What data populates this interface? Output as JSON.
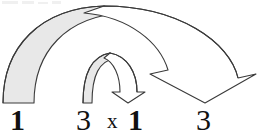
{
  "figure": {
    "background_color": "#ffffff",
    "stroke_color": "#3a3a3a",
    "fill_gray": "#e8e8e8",
    "text_color": "#111111",
    "width": 260,
    "height": 139
  },
  "expression": {
    "terms": [
      {
        "id": "left-outer",
        "label": "1",
        "weight": "bold",
        "x": 10,
        "y": 1
      },
      {
        "id": "left-inner",
        "label": "3",
        "weight": "normal",
        "x": 76,
        "y": 1
      },
      {
        "id": "times",
        "label": "x",
        "weight": "normal",
        "x": 107,
        "y": 7
      },
      {
        "id": "right-inner",
        "label": "1",
        "weight": "bold",
        "x": 128,
        "y": 1
      },
      {
        "id": "right-outer",
        "label": "3",
        "weight": "normal",
        "x": 196,
        "y": 1
      }
    ]
  },
  "arcs": {
    "outer": {
      "name": "outer-arc-arrow",
      "description": "Large arch from left bold 1 over to right 3",
      "from_term": "1",
      "to_term": "3",
      "filled": true,
      "fill": "#e8e8e8",
      "stroke": "#3a3a3a",
      "arrowhead": "down",
      "tip_x": 205,
      "tip_y": 103
    },
    "inner": {
      "name": "inner-arc-arrow",
      "description": "Small arch from inner 3 over to bold 1",
      "from_term": "3",
      "to_term": "1",
      "filled": true,
      "fill": "#e8e8e8",
      "stroke": "#3a3a3a",
      "arrowhead": "down",
      "tip_x": 128,
      "tip_y": 103
    }
  },
  "artifacts": {
    "scan_smudges": [
      {
        "x": 2,
        "y": 1,
        "w": 16,
        "h": 3
      },
      {
        "x": 22,
        "y": 1,
        "w": 12,
        "h": 3
      },
      {
        "x": 38,
        "y": 2,
        "w": 10,
        "h": 2
      },
      {
        "x": 52,
        "y": 1,
        "w": 9,
        "h": 3
      }
    ]
  }
}
